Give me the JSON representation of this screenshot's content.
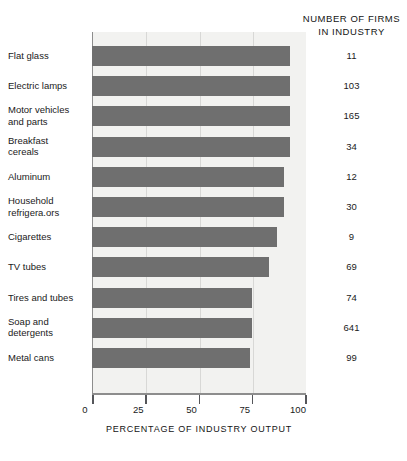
{
  "chart_data": {
    "type": "bar",
    "orientation": "horizontal",
    "title": "",
    "xlabel": "PERCENTAGE OF INDUSTRY OUTPUT",
    "ylabel": "",
    "xlim": [
      0,
      100
    ],
    "xticks": [
      0,
      25,
      50,
      75,
      100
    ],
    "xticklabels": [
      "0",
      "25",
      "50",
      "75",
      "100"
    ],
    "grid": true,
    "legend": null,
    "categories": [
      "Flat glass",
      "Electric lamps",
      "Motor vehicles and parts",
      "Breakfast cereals",
      "Aluminum",
      "Household refrigera.ors",
      "Cigarettes",
      "TV tubes",
      "Tires and tubes",
      "Soap and detergents",
      "Metal cans"
    ],
    "values": [
      93,
      93,
      93,
      93,
      90,
      90,
      87,
      83,
      75,
      75,
      74
    ],
    "annotation_column": {
      "header_line1": "NUMBER OF FIRMS",
      "header_line2": "IN INDUSTRY",
      "values": [
        11,
        103,
        165,
        34,
        12,
        30,
        9,
        69,
        74,
        641,
        99
      ]
    }
  },
  "rows": [
    {
      "label_line1": "Flat glass",
      "label_line2": "",
      "value": 93,
      "firms": "11"
    },
    {
      "label_line1": "Electric lamps",
      "label_line2": "",
      "value": 93,
      "firms": "103"
    },
    {
      "label_line1": "Motor vehicles",
      "label_line2": "and parts",
      "value": 93,
      "firms": "165"
    },
    {
      "label_line1": "Breakfast",
      "label_line2": "cereals",
      "value": 93,
      "firms": "34"
    },
    {
      "label_line1": "Aluminum",
      "label_line2": "",
      "value": 90,
      "firms": "12"
    },
    {
      "label_line1": "Household",
      "label_line2": "refrigera.ors",
      "value": 90,
      "firms": "30"
    },
    {
      "label_line1": "Cigarettes",
      "label_line2": "",
      "value": 87,
      "firms": "9"
    },
    {
      "label_line1": "TV tubes",
      "label_line2": "",
      "value": 83,
      "firms": "69"
    },
    {
      "label_line1": "Tires and tubes",
      "label_line2": "",
      "value": 75,
      "firms": "74"
    },
    {
      "label_line1": "Soap and",
      "label_line2": "detergents",
      "value": 75,
      "firms": "641"
    },
    {
      "label_line1": "Metal cans",
      "label_line2": "",
      "value": 74,
      "firms": "99"
    }
  ],
  "axis": {
    "title": "PERCENTAGE OF INDUSTRY OUTPUT",
    "ticks": [
      "0",
      "25",
      "50",
      "75",
      "100"
    ]
  },
  "firms_column": {
    "header_line1": "NUMBER OF FIRMS",
    "header_line2": "IN INDUSTRY"
  },
  "colors": {
    "bar": "#6f6f6f",
    "plot_background": "#f2f2f0",
    "axis": "#8d8d8d",
    "text": "#1a1a1a"
  }
}
